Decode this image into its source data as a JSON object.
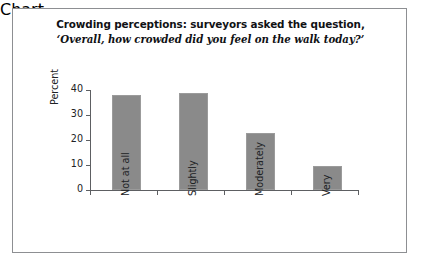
{
  "figure": {
    "title_line1": "Crowding perceptions: surveyors asked the question,",
    "title_line2": "‘Overall, how crowded did you feel on the walk today?’",
    "border_color": "#8d8f92",
    "background": "#ffffff"
  },
  "chart_data": {
    "type": "bar",
    "title": "Crowding perceptions: surveyors asked the question, ‘Overall, how crowded did you feel on the walk today?’",
    "categories": [
      "Not at all",
      "Slightly",
      "Moderately",
      "Very"
    ],
    "values": [
      38,
      39,
      23,
      9.5
    ],
    "xlabel": "",
    "ylabel": "Percent",
    "ylim": [
      0,
      40
    ],
    "yticks": [
      0,
      10,
      20,
      30,
      40
    ],
    "ytick_labels": [
      "0",
      "10",
      "20",
      "30",
      "40"
    ],
    "grid": false,
    "legend": "none",
    "bar_color": "#8a8a8a",
    "bar_edge_color": "#9b9b9b",
    "axis_color": "#5d5f62"
  }
}
